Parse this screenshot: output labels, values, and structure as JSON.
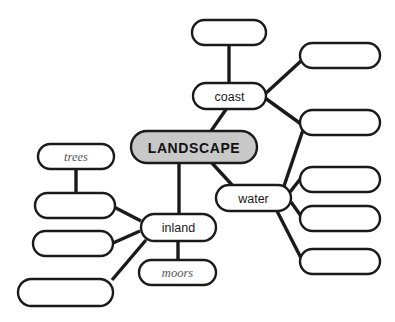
{
  "diagram": {
    "type": "mind-map",
    "title_node": "LANDSCAPE",
    "canvas": {
      "width": 395,
      "height": 322,
      "background": "#ffffff"
    },
    "colors": {
      "central_fill": "#c8c8c8",
      "node_fill": "#ffffff",
      "stroke": "#1a1a1a",
      "text": "#1a1a1a",
      "placeholder_text": "#555555"
    },
    "nodes": [
      {
        "id": "landscape",
        "label": "LANDSCAPE",
        "style": "central",
        "filled": true,
        "x": 131,
        "y": 131,
        "w": 126,
        "h": 32
      },
      {
        "id": "coast",
        "label": "coast",
        "style": "branch",
        "filled": false,
        "x": 193,
        "y": 83,
        "w": 73,
        "h": 26
      },
      {
        "id": "water",
        "label": "water",
        "style": "branch",
        "filled": false,
        "x": 216,
        "y": 185,
        "w": 75,
        "h": 26
      },
      {
        "id": "inland",
        "label": "inland",
        "style": "branch",
        "filled": false,
        "x": 141,
        "y": 214,
        "w": 75,
        "h": 27
      },
      {
        "id": "trees",
        "label": "trees",
        "style": "leaf-italic",
        "filled": false,
        "x": 38,
        "y": 144,
        "w": 76,
        "h": 25
      },
      {
        "id": "moors",
        "label": "moors",
        "style": "leaf-italic",
        "filled": false,
        "x": 139,
        "y": 260,
        "w": 77,
        "h": 25
      },
      {
        "id": "blank-coast-top",
        "label": "",
        "style": "blank",
        "filled": false,
        "x": 192,
        "y": 20,
        "w": 74,
        "h": 25
      },
      {
        "id": "blank-coast-right-1",
        "label": "",
        "style": "blank",
        "filled": false,
        "x": 300,
        "y": 43,
        "w": 80,
        "h": 25
      },
      {
        "id": "blank-coast-water-shared",
        "label": "",
        "style": "blank",
        "filled": false,
        "x": 300,
        "y": 110,
        "w": 80,
        "h": 25
      },
      {
        "id": "blank-water-right-1",
        "label": "",
        "style": "blank",
        "filled": false,
        "x": 300,
        "y": 167,
        "w": 80,
        "h": 25
      },
      {
        "id": "blank-water-right-2",
        "label": "",
        "style": "blank",
        "filled": false,
        "x": 300,
        "y": 206,
        "w": 80,
        "h": 25
      },
      {
        "id": "blank-water-right-3",
        "label": "",
        "style": "blank",
        "filled": false,
        "x": 300,
        "y": 249,
        "w": 80,
        "h": 25
      },
      {
        "id": "blank-inland-left-1",
        "label": "",
        "style": "blank",
        "filled": false,
        "x": 35,
        "y": 193,
        "w": 80,
        "h": 25
      },
      {
        "id": "blank-inland-left-2",
        "label": "",
        "style": "blank",
        "filled": false,
        "x": 33,
        "y": 231,
        "w": 80,
        "h": 25
      },
      {
        "id": "blank-inland-left-3",
        "label": "",
        "style": "blank",
        "filled": false,
        "x": 18,
        "y": 279,
        "w": 95,
        "h": 27
      }
    ],
    "edges": [
      {
        "from": "landscape",
        "to": "coast",
        "x1": 211,
        "y1": 131,
        "x2": 227,
        "y2": 108
      },
      {
        "from": "landscape",
        "to": "water",
        "x1": 211,
        "y1": 162,
        "x2": 233,
        "y2": 186
      },
      {
        "from": "landscape",
        "to": "inland",
        "x1": 179,
        "y1": 162,
        "x2": 179,
        "y2": 215
      },
      {
        "from": "coast",
        "to": "blank-coast-top",
        "x1": 229,
        "y1": 83,
        "x2": 229,
        "y2": 45
      },
      {
        "from": "coast",
        "to": "blank-coast-right-1",
        "x1": 265,
        "y1": 94,
        "x2": 301,
        "y2": 61
      },
      {
        "from": "coast",
        "to": "blank-coast-water-shared",
        "x1": 265,
        "y1": 98,
        "x2": 301,
        "y2": 124
      },
      {
        "from": "water",
        "to": "blank-coast-water-shared",
        "x1": 284,
        "y1": 186,
        "x2": 303,
        "y2": 130
      },
      {
        "from": "water",
        "to": "blank-water-right-1",
        "x1": 290,
        "y1": 192,
        "x2": 301,
        "y2": 178
      },
      {
        "from": "water",
        "to": "blank-water-right-2",
        "x1": 291,
        "y1": 202,
        "x2": 301,
        "y2": 216
      },
      {
        "from": "water",
        "to": "blank-water-right-3",
        "x1": 277,
        "y1": 211,
        "x2": 301,
        "y2": 258
      },
      {
        "from": "inland",
        "to": "moors",
        "x1": 178,
        "y1": 241,
        "x2": 178,
        "y2": 260
      },
      {
        "from": "inland",
        "to": "blank-inland-left-1",
        "x1": 141,
        "y1": 221,
        "x2": 114,
        "y2": 207
      },
      {
        "from": "inland",
        "to": "blank-inland-left-2",
        "x1": 140,
        "y1": 231,
        "x2": 113,
        "y2": 243
      },
      {
        "from": "inland",
        "to": "blank-inland-left-3",
        "x1": 146,
        "y1": 240,
        "x2": 112,
        "y2": 280
      },
      {
        "from": "trees",
        "to": "blank-inland-left-1",
        "x1": 76,
        "y1": 169,
        "x2": 76,
        "y2": 193
      }
    ]
  }
}
